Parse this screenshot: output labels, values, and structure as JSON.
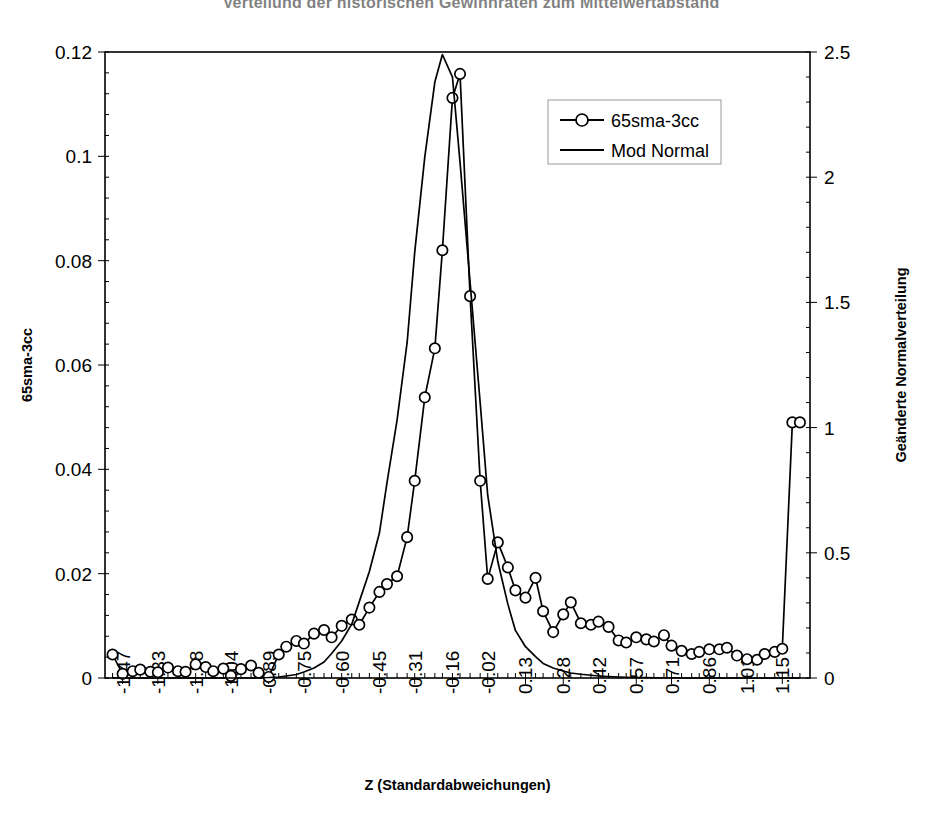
{
  "chart_data": {
    "type": "line",
    "title": "Verteilung der historischen Gewinnraten zum Mittelwertabstand",
    "xlabel": "Z (Standardabweichungen)",
    "ylabel": "65sma-3cc",
    "y2label": "Geänderte Normalverteilung",
    "grid": false,
    "legend_position": "top-center-right",
    "xlim": [
      -1.54,
      1.26
    ],
    "ylim": [
      0,
      0.12
    ],
    "y2lim": [
      0,
      2.5
    ],
    "ytick_labels": [
      "0",
      "0.02",
      "0.04",
      "0.06",
      "0.08",
      "0.1",
      "0.12"
    ],
    "ytick_values": [
      0,
      0.02,
      0.04,
      0.06,
      0.08,
      0.1,
      0.12
    ],
    "y2tick_labels": [
      "0",
      "0.5",
      "1",
      "1.5",
      "2",
      "2.5"
    ],
    "y2tick_values": [
      0,
      0.5,
      1,
      1.5,
      2,
      2.5
    ],
    "xtick_labels": [
      "-1.47",
      "-1.33",
      "-1.18",
      "-1.04",
      "-0.89",
      "-0.75",
      "-0.60",
      "-0.45",
      "-0.31",
      "-0.16",
      "-0.02",
      "0.13",
      "0.28",
      "0.42",
      "0.57",
      "0.71",
      "0.86",
      "1.01",
      "1.15"
    ],
    "xtick_values": [
      -1.47,
      -1.33,
      -1.18,
      -1.04,
      -0.89,
      -0.75,
      -0.6,
      -0.45,
      -0.31,
      -0.16,
      -0.02,
      0.13,
      0.28,
      0.42,
      0.57,
      0.71,
      0.86,
      1.01,
      1.15
    ],
    "x": [
      -1.51,
      -1.47,
      -1.43,
      -1.4,
      -1.36,
      -1.33,
      -1.29,
      -1.25,
      -1.22,
      -1.18,
      -1.14,
      -1.11,
      -1.07,
      -1.04,
      -1.0,
      -0.96,
      -0.93,
      -0.89,
      -0.85,
      -0.82,
      -0.78,
      -0.75,
      -0.71,
      -0.67,
      -0.64,
      -0.6,
      -0.56,
      -0.53,
      -0.49,
      -0.45,
      -0.42,
      -0.38,
      -0.34,
      -0.31,
      -0.27,
      -0.23,
      -0.2,
      -0.16,
      -0.13,
      -0.09,
      -0.05,
      -0.02,
      0.02,
      0.06,
      0.09,
      0.13,
      0.17,
      0.2,
      0.24,
      0.28,
      0.31,
      0.35,
      0.39,
      0.42,
      0.46,
      0.5,
      0.53,
      0.57,
      0.61,
      0.64,
      0.68,
      0.71,
      0.75,
      0.79,
      0.82,
      0.86,
      0.9,
      0.93,
      0.97,
      1.01,
      1.05,
      1.08,
      1.12,
      1.15,
      1.19,
      1.22
    ],
    "series": [
      {
        "name": "65sma-3cc",
        "axis": "left",
        "marker": "circle-open",
        "values": [
          0.0045,
          0.0008,
          0.0013,
          0.0016,
          0.0012,
          0.0011,
          0.002,
          0.0013,
          0.0012,
          0.0026,
          0.0021,
          0.0013,
          0.0018,
          0.0004,
          0.0017,
          0.0024,
          0.001,
          0.0002,
          0.0045,
          0.006,
          0.0071,
          0.0066,
          0.0085,
          0.0092,
          0.0078,
          0.01,
          0.0112,
          0.0102,
          0.0135,
          0.0165,
          0.018,
          0.0195,
          0.027,
          0.0378,
          0.0538,
          0.0632,
          0.082,
          0.1112,
          0.1158,
          0.0732,
          0.0378,
          0.019,
          0.026,
          0.0212,
          0.0168,
          0.0154,
          0.0192,
          0.0128,
          0.0088,
          0.0122,
          0.0145,
          0.0105,
          0.0102,
          0.0108,
          0.0098,
          0.0072,
          0.0068,
          0.0078,
          0.0074,
          0.007,
          0.0082,
          0.0062,
          0.0052,
          0.0046,
          0.005,
          0.0055,
          0.0055,
          0.0058,
          0.0043,
          0.0036,
          0.0035,
          0.0046,
          0.005,
          0.0056,
          0.049,
          0.049
        ]
      },
      {
        "name": "Mod Normal",
        "axis": "right",
        "marker": "none",
        "values": [
          0.0,
          0.0,
          0.0,
          0.0,
          0.0,
          0.0,
          0.0,
          0.0,
          0.0,
          0.0,
          0.0,
          0.0,
          0.0,
          0.0,
          0.0,
          0.0,
          0.001,
          0.002,
          0.004,
          0.008,
          0.014,
          0.024,
          0.04,
          0.064,
          0.098,
          0.148,
          0.215,
          0.305,
          0.425,
          0.58,
          0.78,
          1.03,
          1.34,
          1.7,
          2.08,
          2.38,
          2.49,
          2.4,
          2.06,
          1.58,
          1.1,
          0.73,
          0.465,
          0.295,
          0.19,
          0.125,
          0.085,
          0.058,
          0.04,
          0.028,
          0.02,
          0.015,
          0.011,
          0.008,
          0.006,
          0.004,
          0.003,
          0.002,
          0.002,
          0.001,
          0.001,
          0.001,
          0.0,
          0.0,
          0.0,
          0.0,
          0.0,
          0.0,
          0.0,
          0.0,
          0.0,
          0.0,
          0.0,
          0.0,
          0.0,
          0.0
        ]
      }
    ]
  },
  "legend": {
    "items": [
      {
        "label": "65sma-3cc",
        "style": "line-marker"
      },
      {
        "label": "Mod Normal",
        "style": "line"
      }
    ]
  }
}
